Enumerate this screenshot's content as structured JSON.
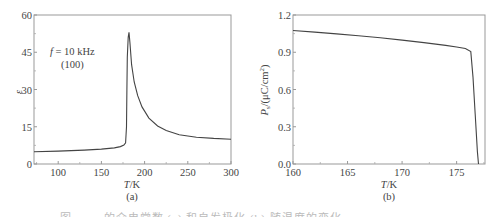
{
  "chart_data": [
    {
      "type": "line",
      "panel_label": "(a)",
      "title": "",
      "xlabel": "T/K",
      "ylabel": "ε",
      "xlim": [
        72,
        300
      ],
      "ylim": [
        0,
        60
      ],
      "xticks": [
        100,
        150,
        200,
        250,
        300
      ],
      "yticks": [
        0,
        15,
        30,
        45,
        60
      ],
      "grid": false,
      "annotations": [
        "f = 10 kHz",
        "(100)"
      ],
      "series": [
        {
          "name": "ε(T)",
          "x": [
            72,
            100,
            130,
            150,
            165,
            172,
            176,
            178,
            179,
            179.5,
            180,
            181,
            182,
            183,
            185,
            188,
            192,
            197,
            205,
            215,
            225,
            240,
            260,
            280,
            300
          ],
          "values": [
            4.9,
            5.2,
            5.6,
            6.0,
            6.5,
            7.0,
            7.6,
            8.5,
            15,
            30,
            43,
            51,
            53,
            49,
            40,
            33,
            27.5,
            23,
            18.5,
            15.3,
            13.5,
            11.8,
            10.8,
            10.3,
            10.0
          ]
        }
      ]
    },
    {
      "type": "line",
      "panel_label": "(b)",
      "title": "",
      "xlabel": "T/K",
      "ylabel": "Ps/(μC/cm²)",
      "xlim": [
        160,
        177.6
      ],
      "ylim": [
        0,
        1.2
      ],
      "xticks": [
        160,
        165,
        170,
        175
      ],
      "yticks": [
        0.0,
        0.3,
        0.6,
        0.9,
        1.2
      ],
      "grid": false,
      "series": [
        {
          "name": "Ps(T)",
          "x": [
            160,
            162,
            164,
            166,
            168,
            170,
            172,
            174,
            175,
            175.8,
            176.3,
            176.5,
            176.7,
            176.9,
            177.0
          ],
          "values": [
            1.075,
            1.062,
            1.048,
            1.033,
            1.016,
            0.998,
            0.978,
            0.955,
            0.942,
            0.93,
            0.905,
            0.7,
            0.4,
            0.1,
            0.0
          ]
        }
      ]
    }
  ],
  "panels": {
    "a": {
      "tick_x": [
        "100",
        "150",
        "200",
        "250",
        "300"
      ],
      "tick_y": [
        "0",
        "15",
        "30",
        "45",
        "60"
      ],
      "xlabel": "T/K",
      "ylabel": "ε",
      "label": "(a)",
      "annot_line1": "f = 10 kHz",
      "annot_line2": "(100)"
    },
    "b": {
      "tick_x": [
        "160",
        "165",
        "170",
        "175"
      ],
      "tick_y": [
        "0.0",
        "0.3",
        "0.6",
        "0.9",
        "1.2"
      ],
      "xlabel": "T/K",
      "ylabel_main": "P",
      "ylabel_sub": "s",
      "ylabel_rest": "/(μC/cm",
      "ylabel_sup": "2",
      "ylabel_end": ")",
      "label": "(b)"
    }
  },
  "caption": "图 …… 的介电常数 (a) 和自发极化 (b) 随温度的变化"
}
